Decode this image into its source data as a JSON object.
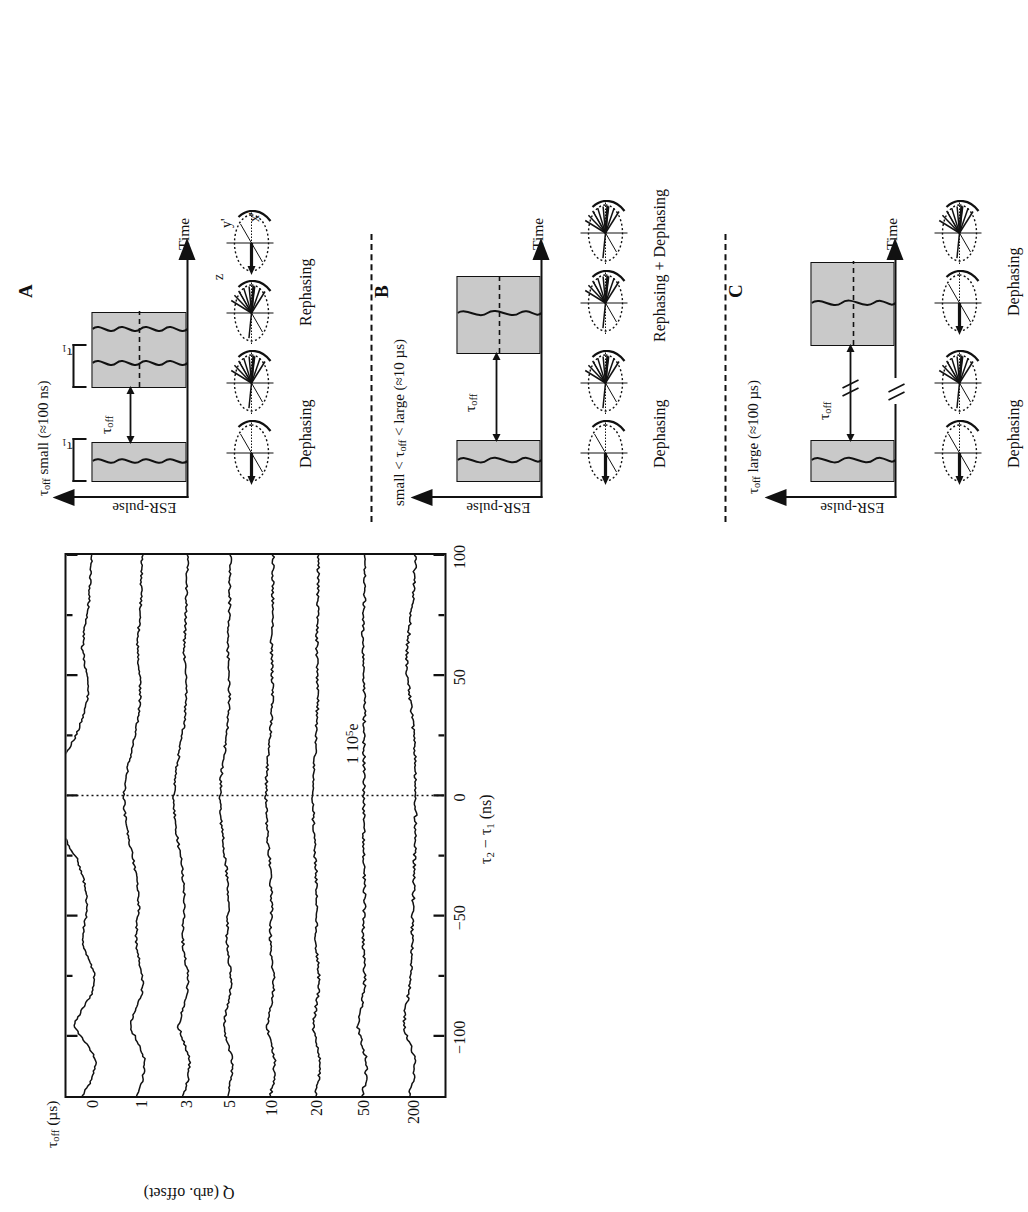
{
  "figure": {
    "panels": [
      "A",
      "B",
      "C",
      "D"
    ]
  },
  "panel_a": {
    "letter": "A",
    "title": "τoff small (≈100 ns)",
    "title_parts": {
      "tau": "τ",
      "sub": "off",
      "rest": " small (≈100 ns)"
    },
    "y_axis_label": "ESR-pulse",
    "x_axis_label": "Time",
    "pulse_width_label": "τ1",
    "gap_label": "τoff",
    "phase_labels": [
      "Dephasing",
      "Rephasing"
    ],
    "bloch_axes": [
      "z",
      "y'",
      "x'"
    ]
  },
  "panel_b": {
    "letter": "B",
    "title": "small < τoff < large (≈10 μs)",
    "y_axis_label": "ESR-pulse",
    "x_axis_label": "Time",
    "gap_label": "τoff",
    "phase_labels": [
      "Dephasing",
      "Rephasing + Dephasing"
    ]
  },
  "panel_c": {
    "letter": "C",
    "title": "τoff large (≈100 μs)",
    "y_axis_label": "ESR-pulse",
    "x_axis_label": "Time",
    "gap_label": "τoff",
    "break_mark": "//",
    "phase_labels": [
      "Dephasing",
      "Dephasing"
    ]
  },
  "panel_d": {
    "letter": "D",
    "scale_bar_label": "1 10⁵e",
    "legend_header": "τoff (μs)"
  },
  "chart_data": {
    "type": "line",
    "title": "",
    "xlabel": "τ2 − τ1 (ns)",
    "ylabel": "Q (arb. offset)",
    "xlim": [
      -125,
      100
    ],
    "xticks": [
      -100,
      -50,
      0,
      50,
      100
    ],
    "xtick_labels": [
      "−100",
      "−50",
      "0",
      "50",
      "100"
    ],
    "minor_xticks": [
      -75,
      -25,
      25,
      75
    ],
    "ylim": [
      0,
      8
    ],
    "yticks": [],
    "grid": false,
    "legend_position": "top (trace offsets)",
    "legend_title": "τoff (μs)",
    "annotations": [
      {
        "text": "1 10⁵e",
        "kind": "scale-bar",
        "x": 62,
        "y": 6.7
      },
      {
        "text": "D",
        "kind": "panel-letter",
        "x": -118,
        "y": 0.45
      }
    ],
    "zero_line": {
      "x": 0,
      "style": "dotted"
    },
    "series": [
      {
        "name": "0",
        "tau_off_us": 0,
        "offset": 7.35,
        "echo_amplitude": 1.0,
        "x": [
          -125,
          -118,
          -110,
          -103,
          -96,
          -89,
          -82,
          -75,
          -68,
          -61,
          -54,
          -47,
          -40,
          -33,
          -26,
          -19,
          -12,
          -6,
          0,
          6,
          12,
          19,
          26,
          33,
          40,
          47,
          54,
          61,
          68,
          75,
          82,
          89,
          96,
          100
        ],
        "y": [
          0.3,
          0.1,
          0.02,
          0.22,
          0.48,
          0.3,
          0.1,
          0.05,
          0.18,
          0.3,
          0.26,
          0.2,
          0.22,
          0.3,
          0.42,
          0.62,
          0.82,
          0.95,
          1.0,
          0.92,
          0.78,
          0.58,
          0.4,
          0.28,
          0.2,
          0.18,
          0.24,
          0.3,
          0.26,
          0.2,
          0.16,
          0.14,
          0.12,
          0.1
        ]
      },
      {
        "name": "1",
        "tau_off_us": 1,
        "offset": 6.3,
        "echo_amplitude": 0.46,
        "x": [
          -125,
          -118,
          -110,
          -103,
          -96,
          -89,
          -82,
          -75,
          -68,
          -61,
          -54,
          -47,
          -40,
          -33,
          -26,
          -19,
          -12,
          -6,
          0,
          6,
          12,
          19,
          26,
          33,
          40,
          47,
          54,
          61,
          68,
          75,
          82,
          89,
          96,
          100
        ],
        "y": [
          0.22,
          0.08,
          0.04,
          0.18,
          0.34,
          0.22,
          0.1,
          0.08,
          0.16,
          0.22,
          0.2,
          0.16,
          0.18,
          0.22,
          0.28,
          0.36,
          0.42,
          0.45,
          0.46,
          0.43,
          0.38,
          0.3,
          0.22,
          0.17,
          0.14,
          0.13,
          0.16,
          0.19,
          0.17,
          0.14,
          0.12,
          0.11,
          0.1,
          0.09
        ]
      },
      {
        "name": "3",
        "tau_off_us": 3,
        "offset": 5.35,
        "echo_amplitude": 0.36,
        "x": [
          -125,
          -118,
          -110,
          -103,
          -96,
          -89,
          -82,
          -75,
          -68,
          -61,
          -54,
          -47,
          -40,
          -33,
          -26,
          -19,
          -12,
          -6,
          0,
          6,
          12,
          19,
          26,
          33,
          40,
          47,
          54,
          61,
          68,
          75,
          82,
          89,
          96,
          100
        ],
        "y": [
          0.18,
          0.07,
          0.04,
          0.15,
          0.27,
          0.18,
          0.09,
          0.07,
          0.13,
          0.18,
          0.17,
          0.14,
          0.15,
          0.18,
          0.22,
          0.28,
          0.33,
          0.35,
          0.36,
          0.34,
          0.3,
          0.24,
          0.18,
          0.14,
          0.12,
          0.11,
          0.13,
          0.16,
          0.14,
          0.12,
          0.11,
          0.1,
          0.09,
          0.08
        ]
      },
      {
        "name": "5",
        "tau_off_us": 5,
        "offset": 4.45,
        "echo_amplitude": 0.28,
        "x": [
          -125,
          -118,
          -110,
          -103,
          -96,
          -89,
          -82,
          -75,
          -68,
          -61,
          -54,
          -47,
          -40,
          -33,
          -26,
          -19,
          -12,
          -6,
          0,
          6,
          12,
          19,
          26,
          33,
          40,
          47,
          54,
          61,
          68,
          75,
          82,
          89,
          96,
          100
        ],
        "y": [
          0.15,
          0.06,
          0.04,
          0.13,
          0.22,
          0.15,
          0.08,
          0.06,
          0.11,
          0.15,
          0.14,
          0.12,
          0.13,
          0.15,
          0.18,
          0.22,
          0.26,
          0.27,
          0.28,
          0.27,
          0.24,
          0.19,
          0.15,
          0.12,
          0.1,
          0.1,
          0.11,
          0.13,
          0.12,
          0.1,
          0.09,
          0.09,
          0.08,
          0.07
        ]
      },
      {
        "name": "10",
        "tau_off_us": 10,
        "offset": 3.55,
        "echo_amplitude": 0.22,
        "x": [
          -125,
          -118,
          -110,
          -103,
          -96,
          -89,
          -82,
          -75,
          -68,
          -61,
          -54,
          -47,
          -40,
          -33,
          -26,
          -19,
          -12,
          -6,
          0,
          6,
          12,
          19,
          26,
          33,
          40,
          47,
          54,
          61,
          68,
          75,
          82,
          89,
          96,
          100
        ],
        "y": [
          0.13,
          0.06,
          0.04,
          0.12,
          0.19,
          0.13,
          0.07,
          0.06,
          0.1,
          0.13,
          0.12,
          0.1,
          0.11,
          0.13,
          0.15,
          0.18,
          0.2,
          0.21,
          0.22,
          0.21,
          0.19,
          0.16,
          0.13,
          0.1,
          0.09,
          0.09,
          0.1,
          0.11,
          0.1,
          0.09,
          0.08,
          0.08,
          0.07,
          0.07
        ]
      },
      {
        "name": "20",
        "tau_off_us": 20,
        "offset": 2.6,
        "echo_amplitude": 0.17,
        "x": [
          -125,
          -118,
          -110,
          -103,
          -96,
          -89,
          -82,
          -75,
          -68,
          -61,
          -54,
          -47,
          -40,
          -33,
          -26,
          -19,
          -12,
          -6,
          0,
          6,
          12,
          19,
          26,
          33,
          40,
          47,
          54,
          61,
          68,
          75,
          82,
          89,
          96,
          100
        ],
        "y": [
          0.12,
          0.05,
          0.04,
          0.11,
          0.17,
          0.12,
          0.07,
          0.05,
          0.09,
          0.12,
          0.11,
          0.09,
          0.1,
          0.11,
          0.13,
          0.15,
          0.16,
          0.17,
          0.17,
          0.17,
          0.15,
          0.13,
          0.11,
          0.09,
          0.08,
          0.08,
          0.09,
          0.1,
          0.09,
          0.08,
          0.08,
          0.07,
          0.07,
          0.06
        ]
      },
      {
        "name": "50",
        "tau_off_us": 50,
        "offset": 1.6,
        "echo_amplitude": 0.1,
        "x": [
          -125,
          -118,
          -110,
          -103,
          -96,
          -89,
          -82,
          -75,
          -68,
          -61,
          -54,
          -47,
          -40,
          -33,
          -26,
          -19,
          -12,
          -6,
          0,
          6,
          12,
          19,
          26,
          33,
          40,
          47,
          54,
          61,
          68,
          75,
          82,
          89,
          96,
          100
        ],
        "y": [
          0.14,
          0.06,
          0.05,
          0.14,
          0.22,
          0.16,
          0.1,
          0.08,
          0.1,
          0.12,
          0.11,
          0.09,
          0.09,
          0.1,
          0.1,
          0.1,
          0.1,
          0.1,
          0.1,
          0.1,
          0.1,
          0.1,
          0.1,
          0.09,
          0.09,
          0.1,
          0.12,
          0.13,
          0.12,
          0.1,
          0.09,
          0.08,
          0.08,
          0.07
        ]
      },
      {
        "name": "200",
        "tau_off_us": 200,
        "offset": 0.55,
        "echo_amplitude": 0.06,
        "x": [
          -125,
          -118,
          -110,
          -103,
          -96,
          -89,
          -82,
          -75,
          -68,
          -61,
          -54,
          -47,
          -40,
          -33,
          -26,
          -19,
          -12,
          -6,
          0,
          6,
          12,
          19,
          26,
          33,
          40,
          47,
          54,
          61,
          68,
          75,
          82,
          89,
          96,
          100
        ],
        "y": [
          0.2,
          0.1,
          0.06,
          0.18,
          0.3,
          0.26,
          0.2,
          0.16,
          0.14,
          0.13,
          0.12,
          0.11,
          0.1,
          0.09,
          0.08,
          0.07,
          0.06,
          0.06,
          0.06,
          0.06,
          0.07,
          0.08,
          0.1,
          0.13,
          0.17,
          0.21,
          0.24,
          0.23,
          0.19,
          0.15,
          0.11,
          0.09,
          0.07,
          0.06
        ]
      }
    ]
  }
}
